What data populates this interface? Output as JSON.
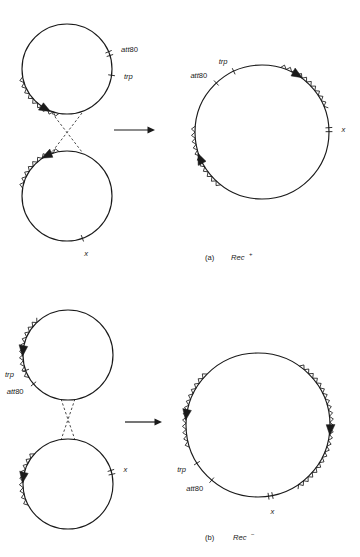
{
  "figure": {
    "title_present": false,
    "background_color": "#ffffff",
    "ink_color": "#1a1a1a",
    "panels": [
      {
        "id": "a",
        "caption_index": "(a)",
        "caption_gene": "Rec",
        "caption_superscript": "+",
        "caption_full": "(a)  Rec+",
        "left_group": {
          "description": "two separate circular chromosomes aligned vertically with a dashed crossover X between them",
          "circles": [
            {
              "name": "upper-circle",
              "cx": 67,
              "cy": 69,
              "r": 45,
              "labels": [
                {
                  "text_italic": "att",
                  "text_roman": "80",
                  "marker": "double-tick",
                  "angle_deg": -20
                },
                {
                  "text_italic": "trp",
                  "text_roman": "",
                  "marker": "single-tick",
                  "angle_deg": 8
                }
              ],
              "zigzag_arcs": [
                {
                  "from_deg": 100,
                  "to_deg": 170,
                  "arrow_at_deg": 118,
                  "arrow_dir": "counterclockwise"
                }
              ]
            },
            {
              "name": "lower-circle",
              "cx": 67,
              "cy": 196,
              "r": 45,
              "labels": [
                {
                  "text_italic": "x",
                  "text_roman": "",
                  "marker": "single-tick",
                  "angle_deg": 70
                }
              ],
              "zigzag_arcs": [
                {
                  "from_deg": 190,
                  "to_deg": 260,
                  "arrow_at_deg": 243,
                  "arrow_dir": "counterclockwise"
                }
              ]
            }
          ],
          "crossover": {
            "style": "dashed",
            "shape": "X"
          }
        },
        "arrow": {
          "name": "reaction-arrow",
          "direction": "right",
          "x1": 114,
          "y1": 130,
          "x2": 155,
          "y2": 130
        },
        "right_group": {
          "circles": [
            {
              "name": "product-circle",
              "cx": 262,
              "cy": 132,
              "r": 67,
              "labels": [
                {
                  "text_italic": "trp",
                  "text_roman": "",
                  "marker": "single-tick",
                  "angle_deg": -115
                },
                {
                  "text_italic": "att",
                  "text_roman": "80",
                  "marker": "single-tick",
                  "angle_deg": -133
                },
                {
                  "text_italic": "x",
                  "text_roman": "",
                  "marker": "double-tick",
                  "angle_deg": -2
                }
              ],
              "zigzag_arcs": [
                {
                  "from_deg": -74,
                  "to_deg": -20,
                  "arrow_at_deg": -58,
                  "arrow_dir": "clockwise"
                },
                {
                  "from_deg": 128,
                  "to_deg": 185,
                  "arrow_at_deg": 157,
                  "arrow_dir": "clockwise"
                }
              ]
            }
          ]
        }
      },
      {
        "id": "b",
        "caption_index": "(b)",
        "caption_gene": "Rec",
        "caption_superscript": "−",
        "caption_full": "(b)  Rec−",
        "left_group": {
          "description": "two separate circular chromosomes aligned vertically with a dashed crossover X between them",
          "circles": [
            {
              "name": "upper-circle",
              "cx": 68,
              "cy": 355,
              "r": 45,
              "labels": [
                {
                  "text_italic": "trp",
                  "text_roman": "",
                  "marker": "single-tick",
                  "angle_deg": 160
                },
                {
                  "text_italic": "att",
                  "text_roman": "80",
                  "marker": "single-tick",
                  "angle_deg": 140
                }
              ],
              "zigzag_arcs": [
                {
                  "from_deg": 150,
                  "to_deg": 230,
                  "arrow_at_deg": 185,
                  "arrow_dir": "counterclockwise"
                }
              ]
            },
            {
              "name": "lower-circle",
              "cx": 68,
              "cy": 484,
              "r": 45,
              "labels": [
                {
                  "text_italic": "x",
                  "text_roman": "",
                  "marker": "double-tick",
                  "angle_deg": -15
                }
              ],
              "zigzag_arcs": [
                {
                  "from_deg": 152,
                  "to_deg": 222,
                  "arrow_at_deg": 188,
                  "arrow_dir": "counterclockwise"
                }
              ]
            }
          ],
          "crossover": {
            "style": "dashed",
            "shape": "X"
          }
        },
        "arrow": {
          "name": "reaction-arrow",
          "direction": "right",
          "x1": 125,
          "y1": 422,
          "x2": 162,
          "y2": 422
        },
        "right_group": {
          "circles": [
            {
              "name": "product-circle",
              "cx": 258,
              "cy": 425,
              "r": 72,
              "labels": [
                {
                  "text_italic": "trp",
                  "text_roman": "",
                  "marker": "single-tick",
                  "angle_deg": 148
                },
                {
                  "text_italic": "att",
                  "text_roman": "80",
                  "marker": "single-tick",
                  "angle_deg": 130
                },
                {
                  "text_italic": "x",
                  "text_roman": "",
                  "marker": "double-tick",
                  "angle_deg": 80
                }
              ],
              "zigzag_arcs": [
                {
                  "from_deg": 162,
                  "to_deg": 225,
                  "arrow_at_deg": 188,
                  "arrow_dir": "counterclockwise"
                },
                {
                  "from_deg": -55,
                  "to_deg": 58,
                  "arrow_at_deg": 4,
                  "arrow_dir": "clockwise"
                }
              ]
            }
          ]
        }
      }
    ],
    "legend_keys": {
      "zigzag_meaning": "phage/lambda-like DNA segment (sawtooth)",
      "solid_line_meaning": "bacterial chromosome DNA",
      "dashed_line_meaning": "recombination crossover",
      "tick_meaning": "genetic marker position",
      "triangle_meaning": "orientation arrowhead"
    }
  }
}
